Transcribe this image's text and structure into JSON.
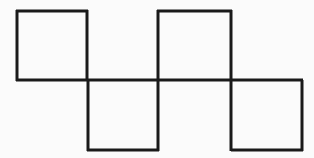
{
  "figure": {
    "name": "matchstick-square-puzzle",
    "canvas": {
      "width": 314,
      "height": 158,
      "background_color": "#fbfbfb"
    },
    "style": {
      "stroke_color": "#1a1a1a",
      "stroke_width": 3.2,
      "stroke_width_thin": 3.0
    },
    "grid": {
      "columns_x": [
        16,
        87,
        158,
        231,
        302
      ],
      "rows_y": [
        10,
        80,
        151
      ],
      "cell_width": 71,
      "cell_height": 70,
      "column_count": 4,
      "row_count": 2
    },
    "squares": [
      {
        "id": "square-top-left",
        "row": "top",
        "column": 1,
        "x": 16,
        "y": 10,
        "width": 71,
        "height": 70,
        "closed": true
      },
      {
        "id": "square-top-right",
        "row": "top",
        "column": 3,
        "x": 158,
        "y": 10,
        "width": 73,
        "height": 70,
        "closed": true
      },
      {
        "id": "square-bottom-left",
        "row": "bottom",
        "column": 2,
        "x": 87,
        "y": 80,
        "width": 71,
        "height": 71,
        "closed": true
      },
      {
        "id": "square-bottom-right",
        "row": "bottom",
        "column": 4,
        "x": 231,
        "y": 80,
        "width": 71,
        "height": 71,
        "closed": true
      }
    ],
    "segments": {
      "horizontal": [
        {
          "id": "top-edge-col1",
          "name": "top-segment-left",
          "x1": 16,
          "y1": 11,
          "x2": 88,
          "y2": 11
        },
        {
          "id": "top-edge-col3",
          "name": "top-segment-right",
          "x1": 157,
          "y1": 11,
          "x2": 232,
          "y2": 11
        },
        {
          "id": "middle-edge-full",
          "name": "middle-horizontal-rail",
          "x1": 16,
          "y1": 80,
          "x2": 303,
          "y2": 80
        },
        {
          "id": "bottom-edge-col2",
          "name": "bottom-segment-left",
          "x1": 87,
          "y1": 150,
          "x2": 159,
          "y2": 150
        },
        {
          "id": "bottom-edge-col4",
          "name": "bottom-segment-right",
          "x1": 231,
          "y1": 150,
          "x2": 303,
          "y2": 150
        }
      ],
      "vertical": [
        {
          "id": "v-top-1",
          "name": "top-vertical-x16",
          "x1": 17,
          "y1": 10,
          "x2": 17,
          "y2": 81
        },
        {
          "id": "v-top-2",
          "name": "top-vertical-x87",
          "x1": 87,
          "y1": 10,
          "x2": 87,
          "y2": 81
        },
        {
          "id": "v-top-3",
          "name": "top-vertical-x158",
          "x1": 158,
          "y1": 10,
          "x2": 158,
          "y2": 81
        },
        {
          "id": "v-top-4",
          "name": "top-vertical-x231",
          "x1": 231,
          "y1": 10,
          "x2": 231,
          "y2": 81
        },
        {
          "id": "v-bot-1",
          "name": "bottom-vertical-x87",
          "x1": 88,
          "y1": 80,
          "x2": 88,
          "y2": 151
        },
        {
          "id": "v-bot-2",
          "name": "bottom-vertical-x158",
          "x1": 158,
          "y1": 80,
          "x2": 158,
          "y2": 151
        },
        {
          "id": "v-bot-3",
          "name": "bottom-vertical-x231",
          "x1": 231,
          "y1": 80,
          "x2": 231,
          "y2": 151
        },
        {
          "id": "v-bot-4",
          "name": "bottom-vertical-x302",
          "x1": 302,
          "y1": 80,
          "x2": 302,
          "y2": 151
        }
      ]
    },
    "counts": {
      "total_segments": 13,
      "horizontal_segments": 5,
      "vertical_segments": 8,
      "complete_squares": 4
    }
  }
}
